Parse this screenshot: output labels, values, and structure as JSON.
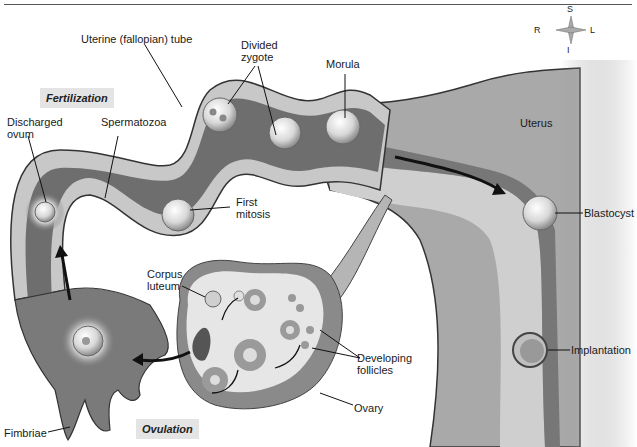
{
  "figure": {
    "title": "",
    "stages": {
      "fertilization": "Fertilization",
      "ovulation": "Ovulation"
    },
    "compass": {
      "superior": "S",
      "inferior": "I",
      "right": "R",
      "left": "L"
    },
    "labels": {
      "uterine_tube": "Uterine (fallopian) tube",
      "divided_zygote": "Divided\nzygote",
      "morula": "Morula",
      "discharged_ovum": "Discharged\novum",
      "spermatozoa": "Spermatozoa",
      "first_mitosis": "First\nmitosis",
      "uterus": "Uterus",
      "blastocyst": "Blastocyst",
      "corpus_luteum": "Corpus\nluteum",
      "developing_follicles": "Developing\nfollicles",
      "implantation": "Implantation",
      "ovary": "Ovary",
      "fimbriae": "Fimbriae"
    },
    "colors": {
      "tube_wall_outer": "#5a5a5a",
      "tube_wall_light": "#c8c8c8",
      "tube_lumen": "#6e6e6e",
      "uterus_tissue": "#a9a9a9",
      "uterus_lining": "#cfcfcf",
      "ovary_outer": "#8a8a8a",
      "ovary_inner": "#e6e6e6",
      "label_bg": "#e4e4e4",
      "arrow": "#111111"
    }
  }
}
